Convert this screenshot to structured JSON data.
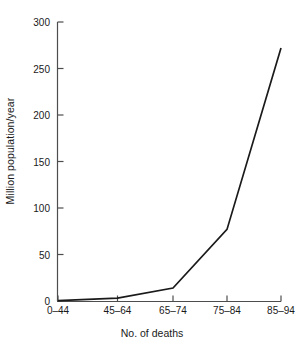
{
  "chart_data": {
    "type": "line",
    "title": "",
    "subtitle": "",
    "xlabel": "No. of deaths",
    "ylabel": "Million population/year",
    "categories": [
      "0–44",
      "45–64",
      "65–74",
      "75–84",
      "85–94"
    ],
    "values": [
      0.5,
      3,
      14,
      77,
      272
    ],
    "series": [
      {
        "name": "Million population/year",
        "values": [
          0.5,
          3,
          14,
          77,
          272
        ]
      }
    ],
    "ylim": [
      0,
      300
    ],
    "ytick_labels": [
      "0",
      "50",
      "100",
      "150",
      "200",
      "250",
      "300"
    ],
    "ytick_values": [
      0,
      50,
      100,
      150,
      200,
      250,
      300
    ],
    "xtick_labels": [
      "0–44",
      "45–64",
      "65–74",
      "75–84",
      "85–94"
    ],
    "grid": false,
    "legend": false,
    "legend_position": "none",
    "line_color": "#1a1a1a",
    "axis_color": "#4d4d4d",
    "background_color": "#ffffff",
    "markers": false
  },
  "colors": {
    "line": "#1a1a1a",
    "axis": "#4d4d4d",
    "text": "#1a1a1a",
    "background": "#ffffff"
  }
}
